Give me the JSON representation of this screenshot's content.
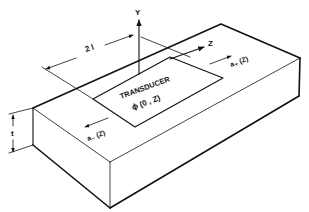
{
  "figure": {
    "type": "isometric slab diagram",
    "labels": {
      "y_axis": "Y",
      "z_axis": "Z",
      "length": "2 l",
      "transducer_title": "TRANSDUCER",
      "transducer_function": "ϕ (0 , Z)",
      "a_plus": "a₊ (Z)",
      "a_minus": "a₋ (Z)",
      "thickness": "t"
    },
    "colors": {
      "ink": "#111111",
      "background": "#ffffff"
    }
  }
}
